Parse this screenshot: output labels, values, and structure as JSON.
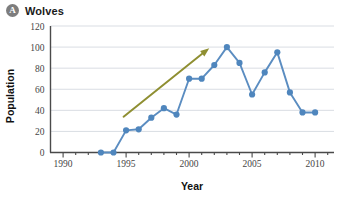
{
  "header": {
    "badge_label": "A",
    "badge_name": "panel-label-a",
    "title": "Wolves"
  },
  "chart_data": {
    "type": "line",
    "title": "Wolves",
    "xlabel": "Year",
    "ylabel": "Population",
    "xlim": [
      1989,
      2011.5
    ],
    "ylim": [
      0,
      120
    ],
    "grid": true,
    "legend": "none",
    "x_ticks": [
      1990,
      1995,
      2000,
      2005,
      2010
    ],
    "x_tick_labels": [
      "1990",
      "1995",
      "2000",
      "2005",
      "2010"
    ],
    "y_ticks": [
      0,
      20,
      40,
      60,
      80,
      100,
      120
    ],
    "y_tick_labels": [
      "0",
      "20",
      "40",
      "60",
      "80",
      "100",
      "120"
    ],
    "x": [
      1993,
      1994,
      1995,
      1996,
      1997,
      1998,
      1999,
      2000,
      2001,
      2002,
      2003,
      2004,
      2005,
      2006,
      2007,
      2008,
      2009,
      2010
    ],
    "values": [
      0,
      0,
      21,
      22,
      33,
      42,
      36,
      70,
      70,
      83,
      100,
      85,
      55,
      76,
      95,
      57,
      38,
      38
    ],
    "series_color": "#4f86bd",
    "annotations": [
      {
        "type": "arrow",
        "name": "trend-arrow",
        "label": "",
        "from": [
          1994.8,
          34
        ],
        "to": [
          2001.6,
          99
        ],
        "color": "#8f8f32"
      }
    ]
  }
}
